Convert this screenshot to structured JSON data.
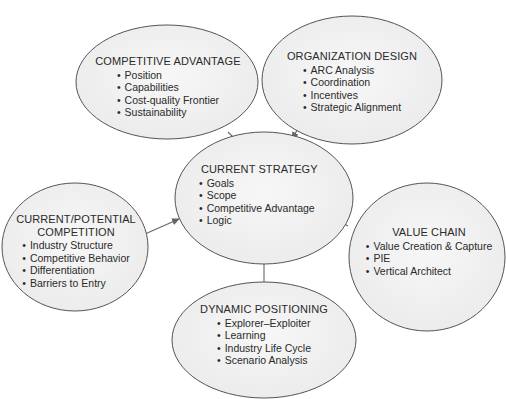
{
  "colors": {
    "ellipse_fill": "#f2f2f2",
    "ellipse_stroke": "#555555",
    "arrow": "#666666",
    "text": "#2a2a2a"
  },
  "nodes": {
    "competitive_advantage": {
      "title": "COMPETITIVE ADVANTAGE",
      "items": [
        "Position",
        "Capabilities",
        "Cost-quality Frontier",
        "Sustainability"
      ]
    },
    "organization_design": {
      "title": "ORGANIZATION DESIGN",
      "items": [
        "ARC Analysis",
        "Coordination",
        "Incentives",
        "Strategic Alignment"
      ]
    },
    "current_strategy": {
      "title": "CURRENT STRATEGY",
      "items": [
        "Goals",
        "Scope",
        "Competitive Advantage",
        "Logic"
      ]
    },
    "current_potential_competition": {
      "title_line1": "CURRENT/POTENTIAL",
      "title_line2": "COMPETITION",
      "items": [
        "Industry Structure",
        "Competitive Behavior",
        "Differentiation",
        "Barriers to Entry"
      ]
    },
    "value_chain": {
      "title": "VALUE CHAIN",
      "items": [
        "Value Creation & Capture",
        "PIE",
        "Vertical Architect"
      ]
    },
    "dynamic_positioning": {
      "title": "DYNAMIC POSITIONING",
      "items": [
        "Explorer–Exploiter",
        "Learning",
        "Industry Life Cycle",
        "Scenario Analysis"
      ]
    }
  },
  "edges": [
    {
      "from": "competitive_advantage",
      "to": "current_strategy"
    },
    {
      "from": "organization_design",
      "to": "current_strategy"
    },
    {
      "from": "current_potential_competition",
      "to": "current_strategy"
    },
    {
      "from": "value_chain",
      "to": "current_strategy"
    },
    {
      "from": "dynamic_positioning",
      "to": "current_strategy"
    }
  ]
}
